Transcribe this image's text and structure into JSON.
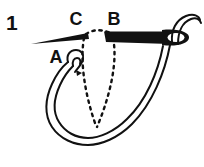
{
  "figure": {
    "number": "1",
    "caption_points": [
      "A",
      "B",
      "C"
    ],
    "ink_color": "#111111",
    "background_color": "#ffffff",
    "width": 204,
    "height": 167
  },
  "labels": {
    "step_number": "1",
    "point_a": "A",
    "point_b": "B",
    "point_c": "C"
  },
  "elements": {
    "needle_name": "sewing-needle",
    "thread_name": "thread-loop",
    "hidden_stitch_name": "hidden-stitch-path"
  }
}
